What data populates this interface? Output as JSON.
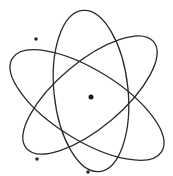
{
  "image": {
    "subject": "atom-icon",
    "stroke_color": "#2a2a2a",
    "background": "#ffffff"
  },
  "nucleus": {
    "cx": 91,
    "cy": 97,
    "r": 2.5
  },
  "orbits": [
    {
      "name": "orbit-vertical",
      "cx": 91,
      "cy": 91,
      "rx": 37,
      "ry": 81,
      "rotate": -6
    },
    {
      "name": "orbit-descending",
      "cx": 87,
      "cy": 105,
      "rx": 88,
      "ry": 35,
      "rotate": 32
    },
    {
      "name": "orbit-ascending",
      "cx": 90,
      "cy": 95,
      "rx": 83,
      "ry": 33,
      "rotate": -40
    }
  ],
  "electrons": [
    {
      "cx": 36,
      "cy": 39,
      "r": 1.8
    },
    {
      "cx": 37,
      "cy": 159,
      "r": 1.8
    },
    {
      "cx": 88,
      "cy": 172,
      "r": 1.8
    }
  ]
}
